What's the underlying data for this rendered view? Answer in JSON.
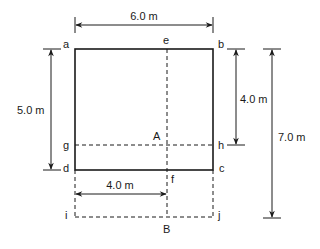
{
  "diagram": {
    "points": {
      "a": "a",
      "b": "b",
      "c": "c",
      "d": "d",
      "e": "e",
      "f": "f",
      "g": "g",
      "h": "h",
      "i": "i",
      "j": "j"
    },
    "regions": {
      "A": "A",
      "B": "B"
    },
    "dimensions": {
      "top_width": "6.0 m",
      "left_height": "5.0 m",
      "right_inner_height": "4.0 m",
      "right_total_height": "7.0 m",
      "bottom_width": "4.0 m"
    },
    "colors": {
      "ink": "#1a1a1a",
      "background": "#ffffff"
    }
  }
}
